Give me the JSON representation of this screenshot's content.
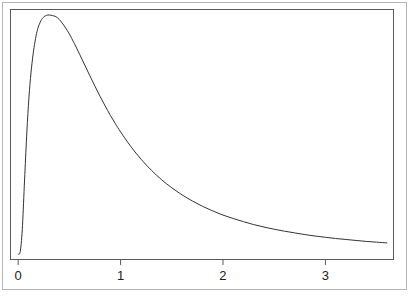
{
  "chart_data": {
    "type": "line",
    "title": "",
    "subtitle": "",
    "xlabel": "",
    "ylabel": "",
    "xlim": [
      -0.07,
      3.66
    ],
    "ylim": [
      0.0,
      1.0
    ],
    "grid": false,
    "legend": null,
    "x_ticks": [
      {
        "value": 0,
        "label": "0"
      },
      {
        "value": 1,
        "label": "1"
      },
      {
        "value": 2,
        "label": "2"
      },
      {
        "value": 3,
        "label": "3"
      }
    ],
    "y_ticks": [],
    "annotations": [],
    "series": [
      {
        "name": "density",
        "color": "#333333",
        "line_width": 1,
        "x": [
          0.0,
          0.02,
          0.04,
          0.06,
          0.08,
          0.1,
          0.12,
          0.14,
          0.16,
          0.18,
          0.2,
          0.23,
          0.26,
          0.29,
          0.32,
          0.35,
          0.37,
          0.4,
          0.43,
          0.46,
          0.5,
          0.55,
          0.6,
          0.65,
          0.7,
          0.75,
          0.8,
          0.85,
          0.9,
          0.95,
          1.0,
          1.1,
          1.2,
          1.3,
          1.4,
          1.5,
          1.6,
          1.7,
          1.8,
          1.9,
          2.0,
          2.1,
          2.2,
          2.3,
          2.4,
          2.5,
          2.6,
          2.7,
          2.8,
          2.9,
          3.0,
          3.1,
          3.2,
          3.3,
          3.4,
          3.5,
          3.6
        ],
        "y": [
          0.02,
          0.03,
          0.12,
          0.3,
          0.48,
          0.63,
          0.74,
          0.82,
          0.88,
          0.925,
          0.955,
          0.982,
          0.995,
          1.0,
          0.999,
          0.996,
          0.993,
          0.982,
          0.967,
          0.949,
          0.922,
          0.882,
          0.839,
          0.795,
          0.751,
          0.708,
          0.666,
          0.627,
          0.589,
          0.554,
          0.521,
          0.461,
          0.409,
          0.364,
          0.325,
          0.292,
          0.263,
          0.238,
          0.216,
          0.197,
          0.18,
          0.166,
          0.153,
          0.141,
          0.131,
          0.122,
          0.114,
          0.107,
          0.1,
          0.094,
          0.089,
          0.084,
          0.08,
          0.076,
          0.072,
          0.069,
          0.066
        ]
      }
    ]
  },
  "figure": {
    "background_color": "#ffffff",
    "outer_border_color": "#b4b4b4",
    "plot_border_color": "#5a5a5a",
    "curve_color": "#333333",
    "tick_color": "#5a5a5a",
    "tick_label_color": "#1a1a1a"
  }
}
